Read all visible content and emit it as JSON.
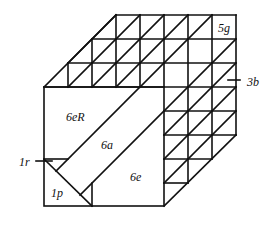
{
  "figure": {
    "line_color": "#111111",
    "background": "#ffffff"
  },
  "labels": {
    "piece_5g": "5g",
    "piece_3b": "3b",
    "piece_6eR": "6eR",
    "piece_6a": "6a",
    "piece_6e": "6e",
    "piece_1r": "1r",
    "piece_1p": "1p"
  },
  "geometry": {
    "grid_step": 24,
    "front_square": {
      "x1": 44,
      "y1": 87,
      "x2": 164,
      "y2": 206
    },
    "back_top_right": {
      "x": 236,
      "y": 15
    }
  }
}
